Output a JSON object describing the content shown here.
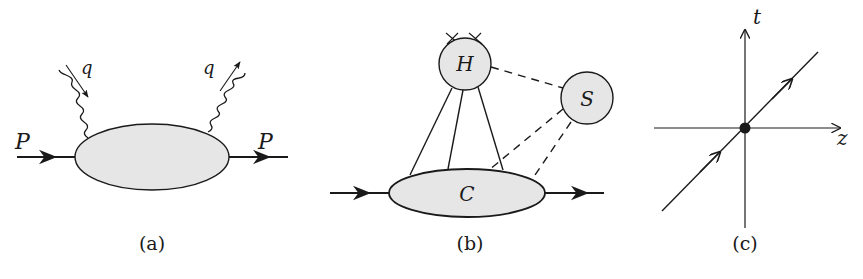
{
  "figure": {
    "panels": [
      {
        "id": "a",
        "caption": "(a)",
        "labels": {
          "incoming_momentum": "P",
          "outgoing_momentum": "P",
          "incoming_photon": "q",
          "outgoing_photon": "q"
        },
        "description": "Forward scattering amplitude: proton P with two photon (q) insertions on a hadronic blob"
      },
      {
        "id": "b",
        "caption": "(b)",
        "labels": {
          "hard": "H",
          "soft": "S",
          "collinear": "C"
        },
        "description": "Reduced diagram: hard subgraph H, soft subgraph S, collinear subgraph C"
      },
      {
        "id": "c",
        "caption": "(c)",
        "labels": {
          "time_axis": "t",
          "space_axis": "z"
        },
        "description": "Light-cone trajectory through the origin in the t-z plane"
      }
    ],
    "colors": {
      "ink": "#1a1a1a",
      "blob_fill": "#e6e6e6",
      "background": "#ffffff"
    }
  }
}
